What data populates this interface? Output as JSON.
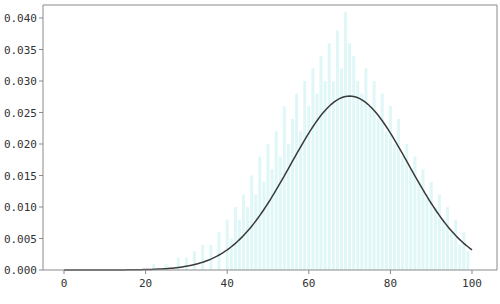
{
  "chart_data": {
    "type": "bar",
    "title": "",
    "xlabel": "",
    "ylabel": "",
    "xlim": [
      -5,
      101.5
    ],
    "ylim": [
      0,
      0.042
    ],
    "grid": false,
    "legend": "none",
    "x_ticks": [
      0,
      20,
      40,
      60,
      80,
      100
    ],
    "x_tick_labels": [
      "0",
      "20",
      "40",
      "60",
      "80",
      "100"
    ],
    "y_ticks": [
      0.0,
      0.005,
      0.01,
      0.015,
      0.02,
      0.025,
      0.03,
      0.035,
      0.04
    ],
    "y_tick_labels": [
      "0.000",
      "0.005",
      "0.010",
      "0.015",
      "0.020",
      "0.025",
      "0.030",
      "0.035",
      "0.040"
    ],
    "colors": {
      "histogram": "#e0f7f7",
      "curve": "#3a3a3a",
      "axes": "#8a8a8a"
    },
    "series": [
      {
        "name": "histogram",
        "kind": "bar",
        "x": [
          22,
          25,
          28,
          30,
          32,
          34,
          36,
          38,
          40,
          41,
          42,
          43,
          44,
          45,
          46,
          47,
          48,
          49,
          50,
          51,
          52,
          53,
          54,
          55,
          56,
          57,
          58,
          59,
          60,
          61,
          62,
          63,
          64,
          65,
          66,
          67,
          68,
          69,
          70,
          71,
          72,
          73,
          74,
          75,
          76,
          77,
          78,
          79,
          80,
          81,
          82,
          83,
          84,
          85,
          86,
          87,
          88,
          89,
          90,
          91,
          92,
          93,
          94,
          95,
          96,
          97,
          98,
          99
        ],
        "values": [
          0.001,
          0.001,
          0.002,
          0.002,
          0.003,
          0.004,
          0.004,
          0.006,
          0.008,
          0.005,
          0.01,
          0.008,
          0.012,
          0.01,
          0.015,
          0.012,
          0.018,
          0.014,
          0.02,
          0.016,
          0.022,
          0.018,
          0.026,
          0.02,
          0.024,
          0.028,
          0.022,
          0.03,
          0.026,
          0.032,
          0.028,
          0.034,
          0.03,
          0.036,
          0.03,
          0.038,
          0.032,
          0.041,
          0.036,
          0.034,
          0.03,
          0.028,
          0.032,
          0.026,
          0.03,
          0.024,
          0.028,
          0.022,
          0.026,
          0.02,
          0.024,
          0.018,
          0.02,
          0.016,
          0.018,
          0.014,
          0.016,
          0.012,
          0.014,
          0.01,
          0.012,
          0.008,
          0.01,
          0.006,
          0.008,
          0.004,
          0.006,
          0.003
        ]
      },
      {
        "name": "normal-pdf",
        "kind": "line",
        "mean": 70,
        "std": 14.45,
        "x_range": [
          0,
          100
        ]
      }
    ]
  }
}
